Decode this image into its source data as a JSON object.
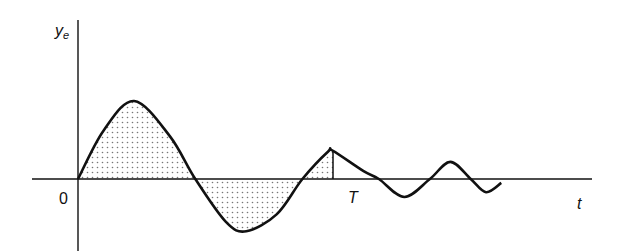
{
  "chart_data": {
    "type": "line",
    "title": "",
    "ylabel": "y",
    "ylabel_subscript": "e",
    "xlabel": "t",
    "origin_label": "0",
    "marker_label": "T",
    "curve_points": [
      [
        0,
        0
      ],
      [
        0.25,
        0.62
      ],
      [
        0.55,
        1.0
      ],
      [
        0.9,
        0.55
      ],
      [
        1.15,
        0
      ],
      [
        1.45,
        -0.55
      ],
      [
        1.65,
        -0.67
      ],
      [
        1.95,
        -0.45
      ],
      [
        2.2,
        0
      ],
      [
        2.45,
        0.35
      ],
      [
        2.5,
        0.36
      ],
      [
        2.8,
        0.1
      ],
      [
        2.95,
        0
      ],
      [
        3.2,
        -0.23
      ],
      [
        3.45,
        0
      ],
      [
        3.65,
        0.22
      ],
      [
        3.85,
        0
      ],
      [
        4.0,
        -0.17
      ],
      [
        4.15,
        -0.05
      ]
    ],
    "T": 2.5,
    "shaded_region": [
      0,
      2.5
    ],
    "grid": false
  },
  "colors": {
    "line": "#111111",
    "shade": "#888888",
    "background": "#ffffff"
  }
}
